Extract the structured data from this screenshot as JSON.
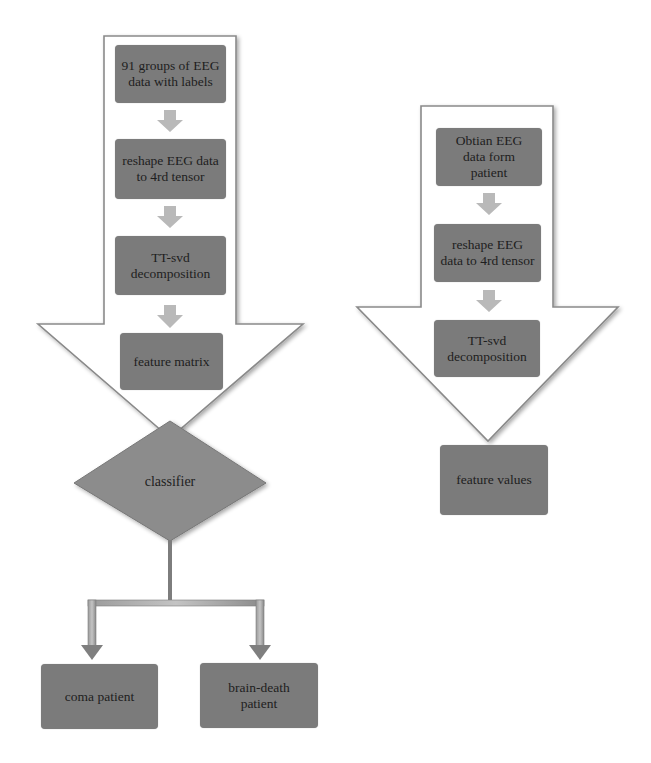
{
  "diagram": {
    "type": "flowchart",
    "colors": {
      "node_fill": "#7b7b7b",
      "small_arrow": "#b8b8b8",
      "outline": "#8a8a8a",
      "diamond_fill": "#8c8c8c",
      "connector": "#808080",
      "text": "#1e1e1e"
    },
    "left_flow": {
      "steps": [
        {
          "label": "91 groups of EEG data with labels"
        },
        {
          "label": "reshape EEG data to 4rd tensor"
        },
        {
          "label": "TT-svd decomposition"
        },
        {
          "label": "feature matrix"
        }
      ],
      "decision": {
        "label": "classifier"
      },
      "outcomes": [
        {
          "label": "coma patient"
        },
        {
          "label": "brain-death patient"
        }
      ]
    },
    "right_flow": {
      "steps": [
        {
          "label": "Obtian EEG data form patient"
        },
        {
          "label": "reshape EEG data to 4rd tensor"
        },
        {
          "label": "TT-svd decomposition"
        }
      ],
      "output": {
        "label": "feature values"
      }
    }
  }
}
